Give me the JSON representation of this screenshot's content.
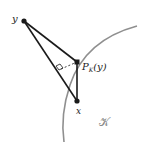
{
  "diagram": {
    "labels": {
      "y": "y",
      "x": "x",
      "projection": "P",
      "projection_sub": "K",
      "projection_arg": "(y)",
      "set": "𝒦"
    },
    "points": {
      "y": [
        24,
        21
      ],
      "projection": [
        77,
        62
      ],
      "x": [
        77,
        101
      ],
      "foot": [
        59,
        70
      ]
    },
    "colors": {
      "lines": "#1a1a1a",
      "boundary": "#8f8f8f",
      "text": "#222222",
      "set_label": "#8a8a8a"
    }
  }
}
